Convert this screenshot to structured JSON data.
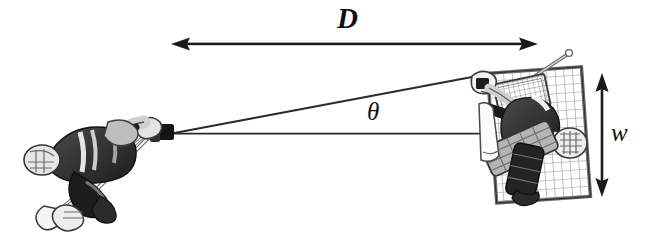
{
  "figure": {
    "background_color": "#ffffff",
    "ink_color": "#1a1a1a",
    "width": 646,
    "height": 242
  },
  "labels": {
    "distance": "D",
    "angle": "θ",
    "net_width": "w"
  },
  "annotations": {
    "distance_arrow": {
      "name": "distance-arrow",
      "orientation": "horizontal",
      "heads": "both",
      "x1": 172,
      "y1": 44,
      "x2": 537,
      "y2": 44
    },
    "net_width_arrow": {
      "name": "net-width-arrow",
      "orientation": "vertical",
      "heads": "both",
      "x1": 602,
      "y1": 74,
      "x2": 602,
      "y2": 196
    },
    "sight_line_upper": {
      "name": "sight-line-upper",
      "x1": 173,
      "y1": 133,
      "x2": 472,
      "y2": 77
    },
    "sight_line_lower": {
      "name": "sight-line-lower",
      "x1": 173,
      "y1": 133,
      "x2": 481,
      "y2": 133
    }
  },
  "figures": {
    "shooter": {
      "name": "hockey-shooter",
      "description": "Hockey player shooting, overhead view, left side",
      "puck_x": 172,
      "puck_y": 133
    },
    "goalie": {
      "name": "hockey-goalie",
      "description": "Goaltender with blocker, catching glove and stick in front of net",
      "center_x": 532,
      "center_y": 133
    },
    "net": {
      "name": "hockey-net",
      "description": "Goal net with mesh",
      "left": 489,
      "top": 68,
      "right": 588,
      "bottom": 201
    }
  },
  "colors": {
    "ink": "#1a1a1a",
    "dark_gray": "#3b3b3b",
    "mid_gray": "#7d7d7d",
    "light_gray": "#b9b9b9",
    "pale_gray": "#d8d8d8",
    "white": "#ffffff"
  }
}
